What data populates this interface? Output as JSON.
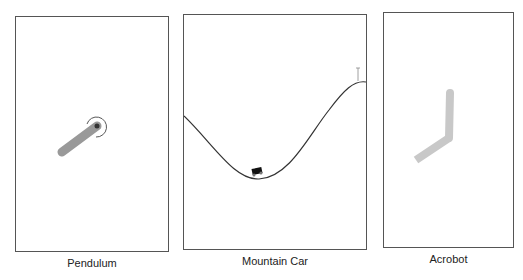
{
  "panels": [
    {
      "id": "pendulum",
      "caption": "Pendulum"
    },
    {
      "id": "mountain-car",
      "caption": "Mountain Car"
    },
    {
      "id": "acrobot",
      "caption": "Acrobot"
    }
  ],
  "colors": {
    "border": "#555555",
    "pole": "#999999",
    "link": "#c8c8c8",
    "track": "#333333",
    "car": "#111111"
  }
}
